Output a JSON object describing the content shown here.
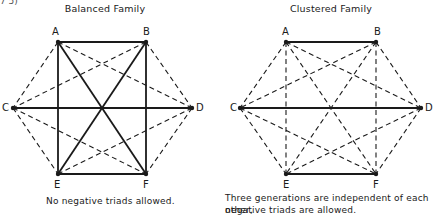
{
  "fragment_top_left": "7 5)",
  "diagrams": [
    {
      "id": "balanced",
      "title": "Balanced Family",
      "caption": "No negative triads allowed.",
      "nodes": {
        "A": {
          "x": 58,
          "y": 42
        },
        "B": {
          "x": 146,
          "y": 42
        },
        "C": {
          "x": 13,
          "y": 108
        },
        "D": {
          "x": 192,
          "y": 108
        },
        "E": {
          "x": 58,
          "y": 174
        },
        "F": {
          "x": 146,
          "y": 174
        }
      },
      "solid_edges": [
        [
          "A",
          "B"
        ],
        [
          "C",
          "D"
        ],
        [
          "E",
          "F"
        ],
        [
          "A",
          "E"
        ],
        [
          "B",
          "F"
        ],
        [
          "A",
          "F"
        ],
        [
          "B",
          "E"
        ]
      ],
      "dashed_edges": [
        [
          "A",
          "C"
        ],
        [
          "A",
          "D"
        ],
        [
          "B",
          "C"
        ],
        [
          "B",
          "D"
        ],
        [
          "C",
          "E"
        ],
        [
          "C",
          "F"
        ],
        [
          "D",
          "E"
        ],
        [
          "D",
          "F"
        ]
      ]
    },
    {
      "id": "clustered",
      "title": "Clustered Family",
      "caption_line1": "Three generations are independent of each other,",
      "caption_line2": "negative triads are allowed.",
      "nodes": {
        "A": {
          "x": 286,
          "y": 42
        },
        "B": {
          "x": 376,
          "y": 42
        },
        "C": {
          "x": 240,
          "y": 108
        },
        "D": {
          "x": 421,
          "y": 108
        },
        "E": {
          "x": 286,
          "y": 174
        },
        "F": {
          "x": 376,
          "y": 174
        }
      },
      "solid_edges": [
        [
          "A",
          "B"
        ],
        [
          "C",
          "D"
        ],
        [
          "E",
          "F"
        ]
      ],
      "dashed_edges": [
        [
          "A",
          "E"
        ],
        [
          "B",
          "F"
        ],
        [
          "A",
          "F"
        ],
        [
          "B",
          "E"
        ],
        [
          "A",
          "C"
        ],
        [
          "A",
          "D"
        ],
        [
          "B",
          "C"
        ],
        [
          "B",
          "D"
        ],
        [
          "C",
          "E"
        ],
        [
          "C",
          "F"
        ],
        [
          "D",
          "E"
        ],
        [
          "D",
          "F"
        ]
      ]
    }
  ],
  "labels": {
    "left": {
      "A": "A",
      "B": "B",
      "C": "C",
      "D": "D",
      "E": "E",
      "F": "F"
    },
    "right": {
      "A": "A",
      "B": "B",
      "C": "C",
      "D": "D",
      "E": "E",
      "F": "F"
    }
  },
  "colors": {
    "ink": "#1a1a1a",
    "background": "#ffffff"
  }
}
